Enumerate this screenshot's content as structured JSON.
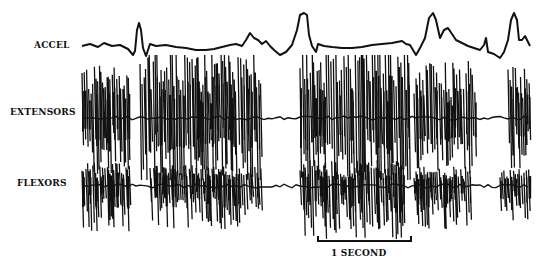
{
  "figure": {
    "traces": [
      {
        "id": "accel",
        "label": "ACCEL"
      },
      {
        "id": "extensors",
        "label": "EXTENSORS"
      },
      {
        "id": "flexors",
        "label": "FLEXORS"
      }
    ],
    "scale_bar": {
      "label": "1 SECOND",
      "x_start": 318,
      "x_end": 411,
      "y": 241
    }
  },
  "chart_data": {
    "type": "line",
    "title": "",
    "series": [
      {
        "name": "ACCEL",
        "points": [
          [
            82,
            46
          ],
          [
            90,
            44
          ],
          [
            98,
            47
          ],
          [
            104,
            43
          ],
          [
            112,
            46
          ],
          [
            120,
            45
          ],
          [
            128,
            49
          ],
          [
            133,
            55
          ],
          [
            135,
            51
          ],
          [
            137,
            30
          ],
          [
            139,
            23
          ],
          [
            141,
            30
          ],
          [
            143,
            48
          ],
          [
            146,
            56
          ],
          [
            150,
            44
          ],
          [
            156,
            46
          ],
          [
            166,
            45
          ],
          [
            176,
            47
          ],
          [
            186,
            48
          ],
          [
            196,
            50
          ],
          [
            206,
            50
          ],
          [
            214,
            49
          ],
          [
            222,
            47
          ],
          [
            230,
            45
          ],
          [
            236,
            44
          ],
          [
            242,
            46
          ],
          [
            246,
            40
          ],
          [
            250,
            33
          ],
          [
            254,
            38
          ],
          [
            258,
            40
          ],
          [
            262,
            44
          ],
          [
            266,
            41
          ],
          [
            270,
            46
          ],
          [
            274,
            50
          ],
          [
            280,
            55
          ],
          [
            286,
            52
          ],
          [
            292,
            45
          ],
          [
            297,
            30
          ],
          [
            300,
            15
          ],
          [
            304,
            13
          ],
          [
            307,
            15
          ],
          [
            309,
            35
          ],
          [
            312,
            46
          ],
          [
            316,
            52
          ],
          [
            318,
            44
          ],
          [
            324,
            46
          ],
          [
            332,
            47
          ],
          [
            342,
            48
          ],
          [
            352,
            48
          ],
          [
            362,
            47
          ],
          [
            372,
            45
          ],
          [
            382,
            44
          ],
          [
            392,
            43
          ],
          [
            402,
            41
          ],
          [
            406,
            44
          ],
          [
            410,
            45
          ],
          [
            413,
            50
          ],
          [
            416,
            55
          ],
          [
            420,
            48
          ],
          [
            425,
            38
          ],
          [
            429,
            18
          ],
          [
            433,
            13
          ],
          [
            436,
            20
          ],
          [
            440,
            38
          ],
          [
            444,
            30
          ],
          [
            448,
            28
          ],
          [
            452,
            34
          ],
          [
            456,
            40
          ],
          [
            460,
            42
          ],
          [
            464,
            44
          ],
          [
            468,
            46
          ],
          [
            474,
            48
          ],
          [
            480,
            50
          ],
          [
            484,
            45
          ],
          [
            486,
            38
          ],
          [
            488,
            52
          ],
          [
            494,
            54
          ],
          [
            500,
            58
          ],
          [
            504,
            52
          ],
          [
            508,
            40
          ],
          [
            511,
            20
          ],
          [
            514,
            13
          ],
          [
            517,
            20
          ],
          [
            519,
            40
          ],
          [
            522,
            40
          ],
          [
            525,
            36
          ],
          [
            528,
            42
          ],
          [
            530,
            46
          ]
        ]
      },
      {
        "name": "EXTENSORS",
        "baseline_y": 118,
        "bursts": [
          [
            82,
            130,
            1.0
          ],
          [
            140,
            262,
            1.2
          ],
          [
            300,
            410,
            1.3
          ],
          [
            414,
            476,
            1.0
          ],
          [
            508,
            530,
            0.9
          ]
        ],
        "spike_top": 60,
        "spike_bottom": 175
      },
      {
        "name": "FLEXORS",
        "baseline_y": 186,
        "bursts": [
          [
            82,
            130,
            0.9
          ],
          [
            150,
            262,
            0.8
          ],
          [
            300,
            405,
            1.0
          ],
          [
            414,
            470,
            0.8
          ],
          [
            500,
            530,
            0.7
          ]
        ],
        "spike_top": 160,
        "spike_bottom": 240
      }
    ],
    "xlabel": "",
    "ylabel": "",
    "annotations": [
      "1 SECOND"
    ],
    "grid": false,
    "legend": "labels at left of each trace"
  }
}
